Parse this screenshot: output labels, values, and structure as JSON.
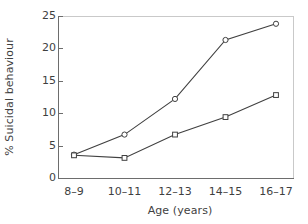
{
  "chart_data": {
    "type": "line",
    "title": "",
    "xlabel": "Age (years)",
    "ylabel": "% Suicidal behaviour",
    "categories": [
      "8–9",
      "10–11",
      "12–13",
      "14–15",
      "16–17"
    ],
    "ylim": [
      0,
      25
    ],
    "yticks": [
      0,
      5,
      10,
      15,
      20,
      25
    ],
    "ytick_labels": [
      "0",
      "5",
      "10",
      "15",
      "20",
      "25"
    ],
    "grid": false,
    "legend": "none",
    "series": [
      {
        "name": "series-circle",
        "marker": "circle",
        "color": "#404040",
        "values": [
          3.6,
          6.7,
          12.2,
          21.3,
          23.8
        ]
      },
      {
        "name": "series-square",
        "marker": "square",
        "color": "#404040",
        "values": [
          3.5,
          3.1,
          6.7,
          9.4,
          12.8
        ]
      }
    ]
  },
  "colors": {
    "line": "#404040",
    "axis": "#6d6d6d",
    "frame": "#c9c9c9",
    "text": "#3f3f3f",
    "background": "#ffffff",
    "marker_fill": "#ffffff"
  }
}
